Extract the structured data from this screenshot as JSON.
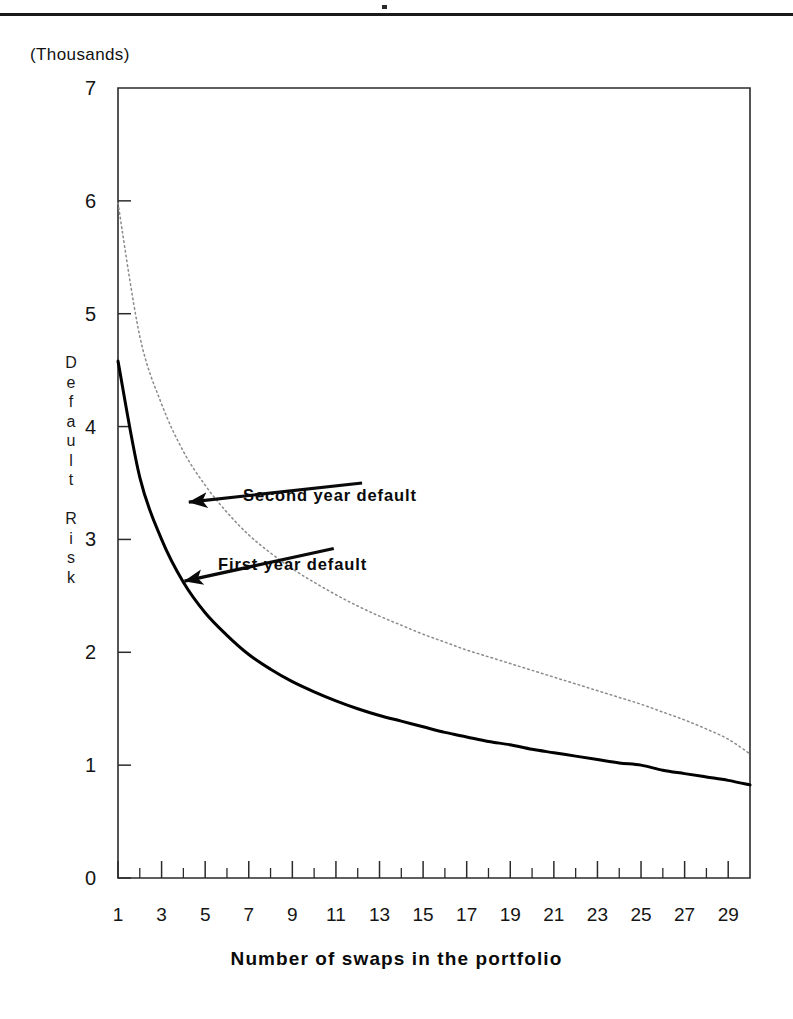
{
  "page": {
    "units_note": "(Thousands)",
    "rule_present": true
  },
  "chart_data": {
    "type": "line",
    "title": "",
    "subtitle": "",
    "units_label": "(Thousands)",
    "xlabel": "Number of swaps in the portfolio",
    "ylabel": "Default Risk",
    "ylabel_vertical_chars": "D\ne\nf\na\nu\nl\nt\n \nR\ni\ns\nk",
    "xlim": [
      1,
      30
    ],
    "ylim": [
      0,
      7
    ],
    "grid": false,
    "legend": "annotations-on-plot",
    "x_tick_labels": [
      "1",
      "3",
      "5",
      "7",
      "9",
      "11",
      "13",
      "15",
      "17",
      "19",
      "21",
      "23",
      "25",
      "27",
      "29"
    ],
    "x_tick_values": [
      1,
      3,
      5,
      7,
      9,
      11,
      13,
      15,
      17,
      19,
      21,
      23,
      25,
      27,
      29
    ],
    "x_minor_tick_values": [
      2,
      4,
      6,
      8,
      10,
      12,
      14,
      16,
      18,
      20,
      22,
      24,
      26,
      28,
      30
    ],
    "y_tick_labels": [
      "0",
      "1",
      "2",
      "3",
      "4",
      "5",
      "6",
      "7"
    ],
    "y_tick_values": [
      0,
      1,
      2,
      3,
      4,
      5,
      6,
      7
    ],
    "x": [
      1,
      2,
      3,
      4,
      5,
      6,
      7,
      8,
      9,
      10,
      11,
      12,
      13,
      14,
      15,
      16,
      17,
      18,
      19,
      20,
      21,
      22,
      23,
      24,
      25,
      26,
      27,
      28,
      29,
      30
    ],
    "series": [
      {
        "name": "First year default",
        "style": "solid",
        "color": "#000000",
        "width": 3,
        "values": [
          4.58,
          3.55,
          3.0,
          2.62,
          2.35,
          2.15,
          1.98,
          1.85,
          1.74,
          1.65,
          1.57,
          1.5,
          1.44,
          1.39,
          1.34,
          1.29,
          1.25,
          1.21,
          1.18,
          1.14,
          1.11,
          1.08,
          1.05,
          1.02,
          1.0,
          0.955,
          0.925,
          0.895,
          0.865,
          0.825
        ]
      },
      {
        "name": "Second year default",
        "style": "dotted",
        "color": "#8a8a8a",
        "width": 1.5,
        "values": [
          5.98,
          4.8,
          4.2,
          3.78,
          3.48,
          3.24,
          3.04,
          2.88,
          2.74,
          2.62,
          2.51,
          2.41,
          2.32,
          2.24,
          2.16,
          2.09,
          2.02,
          1.96,
          1.9,
          1.84,
          1.78,
          1.72,
          1.66,
          1.6,
          1.54,
          1.47,
          1.4,
          1.32,
          1.23,
          1.1
        ]
      }
    ],
    "annotations": [
      {
        "text": "Second year default",
        "arrow_from_x": 12.2,
        "arrow_from_y": 3.5,
        "arrow_to_x": 4.25,
        "arrow_to_y": 3.33
      },
      {
        "text": "First year default",
        "arrow_from_x": 10.9,
        "arrow_from_y": 2.92,
        "arrow_to_x": 4.05,
        "arrow_to_y": 2.63
      }
    ]
  }
}
